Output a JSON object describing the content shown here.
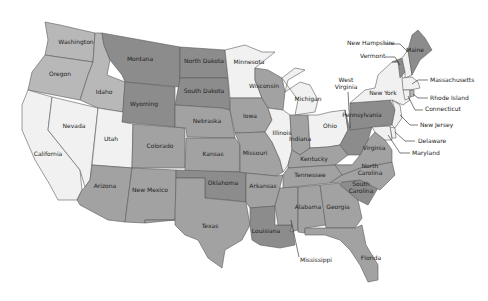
{
  "map": {
    "title": "United States",
    "shades": {
      "lightest": "#f1f1f1",
      "light": "#b8b8b8",
      "medium": "#a2a2a2",
      "dark": "#8c8c8c"
    },
    "states": [
      {
        "id": "WA",
        "name": "Washington",
        "shade": "light",
        "label_xy": [
          76,
          44
        ],
        "points": "45,22 60,25 95,33 93,62 58,57 45,55 48,40"
      },
      {
        "id": "OR",
        "name": "Oregon",
        "shade": "light",
        "label_xy": [
          60,
          76
        ],
        "points": "45,55 58,57 93,62 88,75 80,100 28,90 32,72"
      },
      {
        "id": "CA",
        "name": "California",
        "shade": "lightest",
        "label_xy": [
          48,
          156
        ],
        "points": "28,90 52,97 48,130 80,170 82,190 77,200 58,200 50,185 35,160 22,130 22,105"
      },
      {
        "id": "NV",
        "name": "Nevada",
        "shade": "lightest",
        "label_xy": [
          74,
          128
        ],
        "points": "52,97 98,108 90,180 85,187 80,170 48,130"
      },
      {
        "id": "ID",
        "name": "Idaho",
        "shade": "light",
        "label_xy": [
          104,
          94
        ],
        "points": "95,33 102,33 104,45 110,60 107,75 125,82 123,112 98,108 80,100 88,75 93,62"
      },
      {
        "id": "MT",
        "name": "Montana",
        "shade": "dark",
        "label_xy": [
          140,
          61
        ],
        "points": "102,33 180,47 180,87 125,82 122,75 110,60 104,45"
      },
      {
        "id": "WY",
        "name": "Wyoming",
        "shade": "dark",
        "label_xy": [
          144,
          106
        ],
        "points": "125,82 175,87 175,127 122,122"
      },
      {
        "id": "UT",
        "name": "Utah",
        "shade": "lightest",
        "label_xy": [
          111,
          141
        ],
        "points": "98,108 123,112 122,122 133,124 132,168 92,165"
      },
      {
        "id": "CO",
        "name": "Colorado",
        "shade": "medium",
        "label_xy": [
          160,
          148
        ],
        "points": "133,124 185,128 185,168 132,168"
      },
      {
        "id": "AZ",
        "name": "Arizona",
        "shade": "medium",
        "label_xy": [
          105,
          188
        ],
        "points": "92,165 132,168 125,222 108,220 80,205 77,200 82,190 85,187 90,180"
      },
      {
        "id": "NM",
        "name": "New Mexico",
        "shade": "medium",
        "label_xy": [
          150,
          192
        ],
        "points": "132,168 176,170 175,220 145,220 145,223 125,222"
      },
      {
        "id": "ND",
        "name": "North Dakota",
        "shade": "dark",
        "label_xy": [
          204,
          63
        ],
        "points": "180,47 225,50 228,78 180,78"
      },
      {
        "id": "SD",
        "name": "South Dakota",
        "shade": "dark",
        "label_xy": [
          204,
          93
        ],
        "points": "180,78 228,78 230,110 222,108 175,105"
      },
      {
        "id": "NE",
        "name": "Nebraska",
        "shade": "medium",
        "label_xy": [
          207,
          123
        ],
        "points": "175,105 222,108 230,110 235,138 187,137 186,128 175,127"
      },
      {
        "id": "KS",
        "name": "Kansas",
        "shade": "medium",
        "label_xy": [
          213,
          156
        ],
        "points": "186,138 235,138 240,145 240,172 185,172"
      },
      {
        "id": "OK",
        "name": "Oklahoma",
        "shade": "dark",
        "label_xy": [
          223,
          185
        ],
        "points": "176,170 240,172 246,173 246,202 228,200 205,198 205,178 176,178"
      },
      {
        "id": "TX",
        "name": "Texas",
        "shade": "medium",
        "label_xy": [
          210,
          228
        ],
        "points": "176,178 205,178 205,198 246,202 250,225 242,240 225,250 222,268 208,258 198,240 185,235 175,225 175,220 145,220 145,223 175,220"
      },
      {
        "id": "MN",
        "name": "Minnesota",
        "shade": "lightest",
        "label_xy": [
          249,
          64
        ],
        "points": "225,50 245,45 262,52 275,52 255,68 255,80 262,98 230,98 228,78"
      },
      {
        "id": "IA",
        "name": "Iowa",
        "shade": "medium",
        "label_xy": [
          250,
          118
        ],
        "points": "230,98 262,98 268,108 272,120 265,132 235,133 230,110"
      },
      {
        "id": "MO",
        "name": "Missouri",
        "shade": "medium",
        "label_xy": [
          255,
          155
        ],
        "points": "235,133 265,132 272,142 280,160 283,172 276,176 246,173 240,172 240,145"
      },
      {
        "id": "AR",
        "name": "Arkansas",
        "shade": "medium",
        "label_xy": [
          263,
          188
        ],
        "points": "246,173 276,176 283,175 278,195 275,206 250,208 246,202"
      },
      {
        "id": "LA",
        "name": "Louisiana",
        "shade": "dark",
        "label_xy": [
          266,
          233
        ],
        "points": "250,208 275,206 275,225 292,225 295,245 280,248 260,245 252,240 250,225"
      },
      {
        "id": "WI",
        "name": "Wisconsin",
        "shade": "medium",
        "label_xy": [
          264,
          88
        ],
        "points": "255,68 268,70 282,78 285,92 283,110 268,108 262,98 255,80"
      },
      {
        "id": "IL",
        "name": "Illinois",
        "shade": "lightest",
        "label_xy": [
          282,
          135
        ],
        "points": "268,108 283,110 290,115 292,150 288,165 283,172 280,160 272,142 265,132 272,120"
      },
      {
        "id": "MI",
        "name": "Michigan",
        "shade": "lightest",
        "label_xy": [
          308,
          101
        ],
        "points": "282,78 295,68 305,70 288,80 285,92 300,82 310,85 318,100 315,112 295,115 298,100"
      },
      {
        "id": "IN",
        "name": "Indiana",
        "shade": "medium",
        "label_xy": [
          300,
          141
        ],
        "points": "295,115 308,115 310,148 300,155 292,150 290,115"
      },
      {
        "id": "OH",
        "name": "Ohio",
        "shade": "lightest",
        "label_xy": [
          330,
          128
        ],
        "points": "308,115 318,115 330,112 345,110 348,130 340,145 328,147 310,148"
      },
      {
        "id": "KY",
        "name": "Kentucky",
        "shade": "medium",
        "label_xy": [
          314,
          161
        ],
        "points": "292,150 300,155 310,148 328,147 340,145 348,155 335,165 288,168 288,165"
      },
      {
        "id": "TN",
        "name": "Tennessee",
        "shade": "medium",
        "label_xy": [
          310,
          177
        ],
        "points": "288,168 335,165 352,165 342,175 330,183 283,188 283,175"
      },
      {
        "id": "MS",
        "name": "Mississippi",
        "shade": "medium",
        "label_xy": [
          0,
          0
        ],
        "points": "280,188 298,187 298,230 290,232 292,225 278,225 275,206 278,195"
      },
      {
        "id": "AL",
        "name": "Alabama",
        "shade": "medium",
        "label_xy": [
          308,
          209
        ],
        "points": "298,187 320,185 326,225 305,228 305,233 298,232"
      },
      {
        "id": "GA",
        "name": "Georgia",
        "shade": "medium",
        "label_xy": [
          338,
          209
        ],
        "points": "320,185 340,183 358,200 362,218 355,228 326,228"
      },
      {
        "id": "FL",
        "name": "Florida",
        "shade": "medium",
        "label_xy": [
          371,
          260
        ],
        "points": "305,228 355,228 362,225 366,245 378,265 378,280 368,282 360,265 350,250 340,240 325,235 305,235"
      },
      {
        "id": "SC",
        "name": "South Carolina",
        "shade": "dark",
        "label_xy": [
          0,
          0
        ],
        "points": "342,182 360,180 378,188 368,205 358,200 340,185"
      },
      {
        "id": "NC",
        "name": "North Carolina",
        "shade": "medium",
        "label_xy": [
          0,
          0
        ],
        "points": "330,183 342,175 360,168 392,162 395,175 380,190 360,180 342,182"
      },
      {
        "id": "VA",
        "name": "Virginia",
        "shade": "medium",
        "label_xy": [
          374,
          150
        ],
        "points": "335,165 352,165 360,155 368,140 375,132 385,140 392,150 392,162 360,168 342,175"
      },
      {
        "id": "WV",
        "name": "West Virginia",
        "shade": "dark",
        "label_xy": [
          0,
          0
        ],
        "points": "345,110 350,130 360,127 372,127 368,140 360,155 348,155 340,145 348,130"
      },
      {
        "id": "PA",
        "name": "Pennsylvania",
        "shade": "dark",
        "label_xy": [
          362,
          117
        ],
        "points": "350,103 390,100 395,110 392,125 350,130"
      },
      {
        "id": "NY",
        "name": "New York",
        "shade": "lightest",
        "label_xy": [
          383,
          95
        ],
        "points": "350,103 365,90 375,88 378,75 392,62 398,62 402,75 405,95 410,100 403,105 392,100"
      },
      {
        "id": "NJ",
        "name": "New Jersey",
        "shade": "lightest",
        "label_xy": [
          0,
          0
        ],
        "points": "392,100 400,105 402,118 395,128 392,125 395,110"
      },
      {
        "id": "DE",
        "name": "Delaware",
        "shade": "lightest",
        "label_xy": [
          0,
          0
        ],
        "points": "390,127 395,128 396,138 392,138"
      },
      {
        "id": "MD",
        "name": "Maryland",
        "shade": "lightest",
        "label_xy": [
          0,
          0
        ],
        "points": "372,127 390,126 392,140 385,140 375,132"
      },
      {
        "id": "VT",
        "name": "Vermont",
        "shade": "dark",
        "label_xy": [
          0,
          0
        ],
        "points": "392,62 402,58 405,72 400,78 398,62"
      },
      {
        "id": "NH",
        "name": "New Hampshire",
        "shade": "lightest",
        "label_xy": [
          0,
          0
        ],
        "points": "402,58 408,50 412,75 405,78 405,72"
      },
      {
        "id": "ME",
        "name": "Maine",
        "shade": "dark",
        "label_xy": [
          415,
          52
        ],
        "points": "408,50 412,35 418,30 425,38 432,50 420,60 412,75"
      },
      {
        "id": "MA",
        "name": "Massachusetts",
        "shade": "lightest",
        "label_xy": [
          0,
          0
        ],
        "points": "402,78 412,77 418,82 420,88 410,90 403,90"
      },
      {
        "id": "CT",
        "name": "Connecticut",
        "shade": "lightest",
        "label_xy": [
          0,
          0
        ],
        "points": "403,90 410,90 410,98 405,100"
      },
      {
        "id": "RI",
        "name": "Rhode Island",
        "shade": "light",
        "label_xy": [
          0,
          0
        ],
        "points": "410,90 414,90 414,96 410,97"
      }
    ],
    "external_labels": [
      {
        "name": "New Hampshire",
        "text_xy": [
          347,
          45
        ],
        "line": "384,44 400,44 408,52"
      },
      {
        "name": "Vermont",
        "text_xy": [
          360,
          58
        ],
        "line": "385,57 395,57 400,65"
      },
      {
        "name": "Massachusetts",
        "text_xy": [
          430,
          82
        ],
        "line": "428,80 418,80 412,84"
      },
      {
        "name": "Rhode Island",
        "text_xy": [
          430,
          100
        ],
        "line": "428,98 418,98 413,94"
      },
      {
        "name": "Connecticut",
        "text_xy": [
          425,
          111
        ],
        "line": "423,110 415,110 408,96"
      },
      {
        "name": "New Jersey",
        "text_xy": [
          420,
          127
        ],
        "line": "418,125 410,125 400,115"
      },
      {
        "name": "Delaware",
        "text_xy": [
          418,
          143
        ],
        "line": "415,141 405,141 395,132"
      },
      {
        "name": "Maryland",
        "text_xy": [
          412,
          155
        ],
        "line": "410,153 400,153 388,135"
      },
      {
        "name": "West Virginia",
        "text_xy": [
          346,
          82
        ],
        "text_xy2": [
          346,
          89
        ],
        "line": "348,92 350,128"
      },
      {
        "name": "North Carolina",
        "text_xy": [
          370,
          168
        ],
        "text_xy2": [
          370,
          175
        ],
        "line": ""
      },
      {
        "name": "South Carolina",
        "text_xy": [
          361,
          186
        ],
        "text_xy2": [
          361,
          193
        ],
        "line": ""
      },
      {
        "name": "Mississippi",
        "text_xy": [
          300,
          262
        ],
        "line": "291,220 299,257"
      }
    ]
  }
}
